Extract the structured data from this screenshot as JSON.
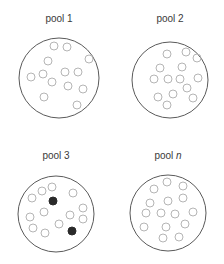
{
  "colors": {
    "outline": "#5a5a5a",
    "ring": "#b5b5b5",
    "filled": "#2a2a2a",
    "text": "#3a3a3a"
  },
  "pools": [
    {
      "label_prefix": "pool ",
      "label_suffix": "1",
      "suffix_italic": false,
      "label_pos": [
        59,
        20
      ],
      "center": [
        59,
        78
      ],
      "radius": 40,
      "items": [
        {
          "x": 54,
          "y": 46,
          "filled": false
        },
        {
          "x": 67,
          "y": 47,
          "filled": false
        },
        {
          "x": 48,
          "y": 61,
          "filled": false
        },
        {
          "x": 89,
          "y": 59,
          "filled": false
        },
        {
          "x": 31,
          "y": 77,
          "filled": false
        },
        {
          "x": 43,
          "y": 74,
          "filled": false
        },
        {
          "x": 52,
          "y": 82,
          "filled": false
        },
        {
          "x": 65,
          "y": 72,
          "filled": false
        },
        {
          "x": 78,
          "y": 72,
          "filled": false
        },
        {
          "x": 68,
          "y": 86,
          "filled": false
        },
        {
          "x": 83,
          "y": 89,
          "filled": false
        },
        {
          "x": 44,
          "y": 97,
          "filled": false
        },
        {
          "x": 77,
          "y": 105,
          "filled": false
        }
      ]
    },
    {
      "label_prefix": "pool ",
      "label_suffix": "2",
      "suffix_italic": false,
      "label_pos": [
        170,
        20
      ],
      "center": [
        170,
        80
      ],
      "radius": 38,
      "items": [
        {
          "x": 167,
          "y": 54,
          "filled": false
        },
        {
          "x": 186,
          "y": 52,
          "filled": false
        },
        {
          "x": 197,
          "y": 58,
          "filled": false
        },
        {
          "x": 160,
          "y": 68,
          "filled": false
        },
        {
          "x": 182,
          "y": 67,
          "filled": false
        },
        {
          "x": 154,
          "y": 79,
          "filled": false
        },
        {
          "x": 168,
          "y": 79,
          "filled": false
        },
        {
          "x": 180,
          "y": 79,
          "filled": false
        },
        {
          "x": 198,
          "y": 78,
          "filled": false
        },
        {
          "x": 187,
          "y": 88,
          "filled": false
        },
        {
          "x": 173,
          "y": 94,
          "filled": false
        },
        {
          "x": 158,
          "y": 97,
          "filled": false
        },
        {
          "x": 193,
          "y": 98,
          "filled": false
        },
        {
          "x": 167,
          "y": 105,
          "filled": false
        }
      ]
    },
    {
      "label_prefix": "pool ",
      "label_suffix": "3",
      "suffix_italic": false,
      "label_pos": [
        56,
        157
      ],
      "center": [
        56,
        214
      ],
      "radius": 38,
      "items": [
        {
          "x": 32,
          "y": 198,
          "filled": false
        },
        {
          "x": 42,
          "y": 191,
          "filled": false
        },
        {
          "x": 52,
          "y": 187,
          "filled": false
        },
        {
          "x": 53,
          "y": 201,
          "filled": true
        },
        {
          "x": 73,
          "y": 193,
          "filled": false
        },
        {
          "x": 83,
          "y": 208,
          "filled": false
        },
        {
          "x": 44,
          "y": 212,
          "filled": false
        },
        {
          "x": 70,
          "y": 215,
          "filled": false
        },
        {
          "x": 30,
          "y": 217,
          "filled": false
        },
        {
          "x": 83,
          "y": 219,
          "filled": false
        },
        {
          "x": 33,
          "y": 228,
          "filled": false
        },
        {
          "x": 59,
          "y": 224,
          "filled": false
        },
        {
          "x": 72,
          "y": 231,
          "filled": true
        },
        {
          "x": 45,
          "y": 233,
          "filled": false
        }
      ]
    },
    {
      "label_prefix": "pool ",
      "label_suffix": "n",
      "suffix_italic": true,
      "label_pos": [
        168,
        157
      ],
      "center": [
        168,
        213
      ],
      "radius": 38,
      "items": [
        {
          "x": 167,
          "y": 182,
          "filled": false
        },
        {
          "x": 154,
          "y": 189,
          "filled": false
        },
        {
          "x": 183,
          "y": 186,
          "filled": false
        },
        {
          "x": 150,
          "y": 203,
          "filled": false
        },
        {
          "x": 168,
          "y": 201,
          "filled": false
        },
        {
          "x": 183,
          "y": 198,
          "filled": false
        },
        {
          "x": 146,
          "y": 213,
          "filled": false
        },
        {
          "x": 161,
          "y": 213,
          "filled": false
        },
        {
          "x": 175,
          "y": 214,
          "filled": false
        },
        {
          "x": 193,
          "y": 212,
          "filled": false
        },
        {
          "x": 144,
          "y": 227,
          "filled": false
        },
        {
          "x": 166,
          "y": 227,
          "filled": false
        },
        {
          "x": 185,
          "y": 224,
          "filled": false
        },
        {
          "x": 163,
          "y": 238,
          "filled": false
        },
        {
          "x": 179,
          "y": 237,
          "filled": false
        }
      ]
    }
  ]
}
